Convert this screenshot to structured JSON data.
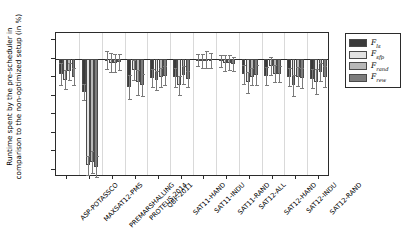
{
  "chart_data": {
    "type": "bar",
    "title": "",
    "xlabel": "",
    "ylabel": "Runtime spent by the pre-scheduler in comparison to the non-optimized setup (in %)",
    "ylim": [
      -32,
      7
    ],
    "yticks": [
      5,
      0,
      -5,
      -10,
      -15,
      -20,
      -25,
      -30
    ],
    "ytick_labels": [
      "5",
      "0",
      "−5",
      "−10",
      "−15",
      "−20",
      "−25",
      "−30"
    ],
    "grid": true,
    "legend_position": "right",
    "categories": [
      "ASP-POTASSCO",
      "MAXSAT12-PMS",
      "PREMARSHALLING",
      "PROTEUS-2014",
      "QBF-2011",
      "SAT11-HAND",
      "SAT11-INDU",
      "SAT11-RAND",
      "SAT12-ALL",
      "SAT12-HAND",
      "SAT12-INDU",
      "SAT12-RAND"
    ],
    "series": [
      {
        "name": "F_ls",
        "color": "#3a3a3a",
        "values": [
          -4.2,
          -9.0,
          -0.4,
          -7.6,
          -5.2,
          -5.0,
          -0.3,
          -0.6,
          -4.2,
          -4.6,
          -5.0,
          -5.4
        ],
        "errors": [
          3.0,
          2.2,
          2.4,
          3.2,
          2.4,
          2.6,
          1.6,
          1.6,
          2.6,
          2.4,
          2.4,
          2.6
        ]
      },
      {
        "name": "F_sfp",
        "color": "#e2e2e2",
        "values": [
          -5.6,
          -28.8,
          -1.0,
          -3.0,
          -5.8,
          -7.2,
          -0.6,
          -1.2,
          -6.4,
          -2.0,
          -7.2,
          -6.2
        ],
        "errors": [
          2.6,
          2.6,
          2.6,
          2.6,
          2.6,
          2.6,
          1.8,
          2.2,
          2.8,
          2.4,
          2.8,
          3.4
        ]
      },
      {
        "name": "F_rand",
        "color": "#b8b8b8",
        "values": [
          -3.4,
          -28.0,
          -1.2,
          -6.4,
          -5.0,
          -4.4,
          -0.2,
          -1.0,
          -4.8,
          -4.0,
          -4.8,
          -3.6
        ],
        "errors": [
          2.2,
          3.0,
          2.4,
          3.4,
          2.6,
          2.4,
          2.4,
          2.0,
          2.4,
          2.4,
          2.6,
          2.4
        ]
      },
      {
        "name": "F_rew",
        "color": "#7d7d7d",
        "values": [
          -4.8,
          -29.2,
          -0.9,
          -7.0,
          -4.6,
          -5.4,
          -0.4,
          -1.4,
          -4.4,
          -4.2,
          -5.2,
          -4.8
        ],
        "errors": [
          2.4,
          2.8,
          2.2,
          3.0,
          2.6,
          2.2,
          2.0,
          2.0,
          2.6,
          2.2,
          2.6,
          2.8
        ]
      }
    ]
  },
  "legend": {
    "entries": [
      {
        "symbol": "F",
        "sub": "ls",
        "color": "#3a3a3a"
      },
      {
        "symbol": "F",
        "sub": "sfp",
        "color": "#e2e2e2"
      },
      {
        "symbol": "F",
        "sub": "rand",
        "color": "#b8b8b8"
      },
      {
        "symbol": "F",
        "sub": "rew",
        "color": "#7d7d7d"
      }
    ]
  }
}
